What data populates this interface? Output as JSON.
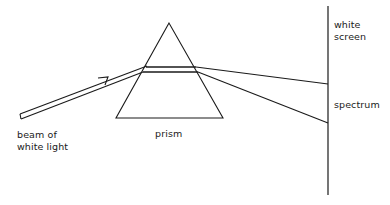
{
  "diagram": {
    "labels": {
      "beam": "beam of\nwhite light",
      "prism": "prism",
      "screen": "white\nscreen",
      "spectrum": "spectrum"
    },
    "colors": {
      "stroke": "#1a1a1a",
      "background": "#ffffff"
    },
    "components": [
      {
        "id": "beam",
        "type": "hollow-arrow-ray",
        "from": [
          19,
          116
        ],
        "to": [
          145,
          67
        ]
      },
      {
        "id": "prism",
        "type": "triangle",
        "apex": [
          169,
          23
        ],
        "base_left": [
          116,
          118
        ],
        "base_right": [
          223,
          118
        ]
      },
      {
        "id": "ray-red",
        "type": "line",
        "from": [
          196,
          67
        ],
        "to": [
          328,
          84
        ]
      },
      {
        "id": "ray-violet",
        "type": "line",
        "from": [
          198,
          72
        ],
        "to": [
          328,
          123
        ]
      },
      {
        "id": "screen",
        "type": "vertical-line",
        "x": 328,
        "y1": 6,
        "y2": 195
      }
    ]
  }
}
